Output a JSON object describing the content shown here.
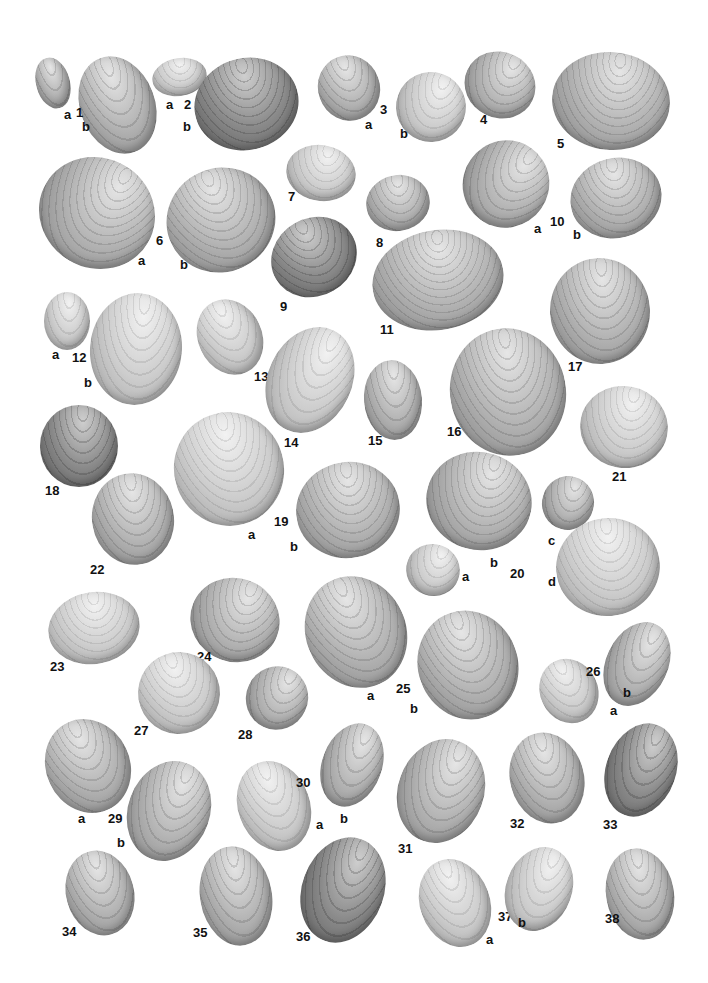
{
  "plate": {
    "background": "#ffffff",
    "specimens": [
      {
        "id": "1a",
        "x": 36,
        "y": 57,
        "w": 34,
        "h": 52,
        "r": -15,
        "tone": "",
        "label": "a",
        "lx": 64,
        "ly": 108
      },
      {
        "id": "1b",
        "x": 80,
        "y": 55,
        "w": 75,
        "h": 100,
        "r": -20,
        "tone": "",
        "label": "b",
        "lx": 82,
        "ly": 120
      },
      {
        "id": "1num",
        "label": "1",
        "lx": 76,
        "ly": 106
      },
      {
        "id": "2a",
        "x": 152,
        "y": 58,
        "w": 55,
        "h": 38,
        "r": -10,
        "tone": "light",
        "label": "a",
        "lx": 166,
        "ly": 98
      },
      {
        "id": "2num",
        "label": "2",
        "lx": 184,
        "ly": 98
      },
      {
        "id": "2b",
        "x": 194,
        "y": 58,
        "w": 105,
        "h": 92,
        "r": -15,
        "tone": "dark",
        "label": "b",
        "lx": 183,
        "ly": 120
      },
      {
        "id": "3a",
        "x": 318,
        "y": 55,
        "w": 62,
        "h": 66,
        "r": -20,
        "tone": "",
        "label": "a",
        "lx": 365,
        "ly": 118
      },
      {
        "id": "3num",
        "label": "3",
        "lx": 380,
        "ly": 103
      },
      {
        "id": "3b",
        "x": 396,
        "y": 72,
        "w": 70,
        "h": 70,
        "r": 20,
        "tone": "light",
        "label": "b",
        "lx": 400,
        "ly": 127
      },
      {
        "id": "4",
        "x": 464,
        "y": 52,
        "w": 72,
        "h": 66,
        "r": 25,
        "tone": "",
        "label": "4",
        "lx": 480,
        "ly": 113
      },
      {
        "id": "5",
        "x": 552,
        "y": 52,
        "w": 118,
        "h": 98,
        "r": 5,
        "tone": "",
        "label": "5",
        "lx": 557,
        "ly": 137
      },
      {
        "id": "6a",
        "x": 38,
        "y": 158,
        "w": 118,
        "h": 110,
        "r": 30,
        "tone": "",
        "label": "a",
        "lx": 138,
        "ly": 254
      },
      {
        "id": "6num",
        "label": "6",
        "lx": 156,
        "ly": 234
      },
      {
        "id": "6b",
        "x": 166,
        "y": 168,
        "w": 110,
        "h": 104,
        "r": -25,
        "tone": "",
        "label": "b",
        "lx": 180,
        "ly": 258
      },
      {
        "id": "7",
        "x": 286,
        "y": 145,
        "w": 70,
        "h": 56,
        "r": 10,
        "tone": "light",
        "label": "7",
        "lx": 288,
        "ly": 190
      },
      {
        "id": "8",
        "x": 366,
        "y": 175,
        "w": 64,
        "h": 56,
        "r": -10,
        "tone": "",
        "label": "8",
        "lx": 376,
        "ly": 236
      },
      {
        "id": "9",
        "x": 270,
        "y": 218,
        "w": 88,
        "h": 78,
        "r": -30,
        "tone": "dark",
        "label": "9",
        "lx": 280,
        "ly": 300
      },
      {
        "id": "10a",
        "x": 463,
        "y": 140,
        "w": 86,
        "h": 88,
        "r": 35,
        "tone": "",
        "label": "a",
        "lx": 534,
        "ly": 222
      },
      {
        "id": "10num",
        "label": "10",
        "lx": 550,
        "ly": 215
      },
      {
        "id": "10b",
        "x": 570,
        "y": 158,
        "w": 92,
        "h": 80,
        "r": -15,
        "tone": "",
        "label": "b",
        "lx": 573,
        "ly": 228
      },
      {
        "id": "11",
        "x": 372,
        "y": 230,
        "w": 132,
        "h": 100,
        "r": -10,
        "tone": "",
        "label": "11",
        "lx": 380,
        "ly": 323
      },
      {
        "id": "12a",
        "x": 44,
        "y": 292,
        "w": 46,
        "h": 58,
        "r": 0,
        "tone": "light",
        "label": "a",
        "lx": 52,
        "ly": 348
      },
      {
        "id": "12num",
        "label": "12",
        "lx": 72,
        "ly": 351
      },
      {
        "id": "12b",
        "x": 90,
        "y": 293,
        "w": 92,
        "h": 112,
        "r": 5,
        "tone": "light",
        "label": "b",
        "lx": 84,
        "ly": 376
      },
      {
        "id": "13",
        "x": 198,
        "y": 298,
        "w": 64,
        "h": 78,
        "r": -25,
        "tone": "light",
        "label": "13",
        "lx": 254,
        "ly": 370
      },
      {
        "id": "14",
        "x": 268,
        "y": 325,
        "w": 84,
        "h": 110,
        "r": 25,
        "tone": "light",
        "label": "14",
        "lx": 284,
        "ly": 436
      },
      {
        "id": "15",
        "x": 364,
        "y": 360,
        "w": 58,
        "h": 80,
        "r": -5,
        "tone": "",
        "label": "15",
        "lx": 368,
        "ly": 434
      },
      {
        "id": "16",
        "x": 450,
        "y": 328,
        "w": 116,
        "h": 128,
        "r": -10,
        "tone": "",
        "label": "16",
        "lx": 447,
        "ly": 425
      },
      {
        "id": "17",
        "x": 550,
        "y": 258,
        "w": 100,
        "h": 106,
        "r": -5,
        "tone": "",
        "label": "17",
        "lx": 568,
        "ly": 360
      },
      {
        "id": "18",
        "x": 40,
        "y": 405,
        "w": 78,
        "h": 82,
        "r": 0,
        "tone": "dark",
        "label": "18",
        "lx": 45,
        "ly": 484
      },
      {
        "id": "19a",
        "x": 174,
        "y": 412,
        "w": 110,
        "h": 114,
        "r": -15,
        "tone": "light",
        "label": "a",
        "lx": 248,
        "ly": 528
      },
      {
        "id": "19num",
        "label": "19",
        "lx": 274,
        "ly": 515
      },
      {
        "id": "19b",
        "x": 296,
        "y": 462,
        "w": 104,
        "h": 96,
        "r": -10,
        "tone": "",
        "label": "b",
        "lx": 290,
        "ly": 540
      },
      {
        "id": "20a",
        "x": 406,
        "y": 544,
        "w": 54,
        "h": 52,
        "r": 20,
        "tone": "light",
        "label": "a",
        "lx": 462,
        "ly": 570
      },
      {
        "id": "20b",
        "x": 426,
        "y": 452,
        "w": 106,
        "h": 98,
        "r": 15,
        "tone": "",
        "label": "b",
        "lx": 490,
        "ly": 556
      },
      {
        "id": "20num",
        "label": "20",
        "lx": 510,
        "ly": 567
      },
      {
        "id": "20c",
        "x": 542,
        "y": 476,
        "w": 52,
        "h": 54,
        "r": 15,
        "tone": "",
        "label": "c",
        "lx": 548,
        "ly": 534
      },
      {
        "id": "20d",
        "x": 556,
        "y": 518,
        "w": 104,
        "h": 98,
        "r": -10,
        "tone": "light",
        "label": "d",
        "lx": 548,
        "ly": 575
      },
      {
        "id": "21",
        "x": 580,
        "y": 386,
        "w": 88,
        "h": 82,
        "r": 10,
        "tone": "light",
        "label": "21",
        "lx": 612,
        "ly": 470
      },
      {
        "id": "22",
        "x": 92,
        "y": 473,
        "w": 82,
        "h": 92,
        "r": -10,
        "tone": "",
        "label": "22",
        "lx": 90,
        "ly": 563
      },
      {
        "id": "23",
        "x": 48,
        "y": 592,
        "w": 92,
        "h": 72,
        "r": -10,
        "tone": "light",
        "label": "23",
        "lx": 50,
        "ly": 660
      },
      {
        "id": "24",
        "x": 190,
        "y": 578,
        "w": 90,
        "h": 84,
        "r": 20,
        "tone": "",
        "label": "24",
        "lx": 197,
        "ly": 650
      },
      {
        "id": "25a",
        "x": 306,
        "y": 575,
        "w": 100,
        "h": 114,
        "r": -25,
        "tone": "",
        "label": "a",
        "lx": 367,
        "ly": 689
      },
      {
        "id": "25num",
        "label": "25",
        "lx": 396,
        "ly": 682
      },
      {
        "id": "25b",
        "x": 418,
        "y": 610,
        "w": 100,
        "h": 110,
        "r": -20,
        "tone": "",
        "label": "b",
        "lx": 410,
        "ly": 702
      },
      {
        "id": "26a",
        "x": 540,
        "y": 658,
        "w": 58,
        "h": 66,
        "r": -25,
        "tone": "light",
        "label": "a",
        "lx": 610,
        "ly": 704
      },
      {
        "id": "26num",
        "label": "26",
        "lx": 586,
        "ly": 665
      },
      {
        "id": "26b",
        "x": 606,
        "y": 620,
        "w": 62,
        "h": 88,
        "r": 25,
        "tone": "",
        "label": "b",
        "lx": 623,
        "ly": 686
      },
      {
        "id": "27",
        "x": 138,
        "y": 652,
        "w": 82,
        "h": 82,
        "r": -20,
        "tone": "light",
        "label": "27",
        "lx": 134,
        "ly": 724
      },
      {
        "id": "28",
        "x": 246,
        "y": 666,
        "w": 62,
        "h": 64,
        "r": 25,
        "tone": "",
        "label": "28",
        "lx": 238,
        "ly": 728
      },
      {
        "id": "29a",
        "x": 46,
        "y": 718,
        "w": 84,
        "h": 96,
        "r": -25,
        "tone": "",
        "label": "a",
        "lx": 78,
        "ly": 812
      },
      {
        "id": "29num",
        "label": "29",
        "lx": 108,
        "ly": 812
      },
      {
        "id": "29b",
        "x": 128,
        "y": 760,
        "w": 82,
        "h": 102,
        "r": 20,
        "tone": "",
        "label": "b",
        "lx": 117,
        "ly": 836
      },
      {
        "id": "30a",
        "x": 238,
        "y": 760,
        "w": 72,
        "h": 92,
        "r": -20,
        "tone": "light",
        "label": "a",
        "lx": 316,
        "ly": 818
      },
      {
        "id": "30num",
        "label": "30",
        "lx": 296,
        "ly": 776
      },
      {
        "id": "30b",
        "x": 322,
        "y": 722,
        "w": 60,
        "h": 86,
        "r": 20,
        "tone": "",
        "label": "b",
        "lx": 340,
        "ly": 812
      },
      {
        "id": "31",
        "x": 398,
        "y": 738,
        "w": 86,
        "h": 106,
        "r": 20,
        "tone": "",
        "label": "31",
        "lx": 398,
        "ly": 842
      },
      {
        "id": "32",
        "x": 510,
        "y": 732,
        "w": 74,
        "h": 92,
        "r": -15,
        "tone": "",
        "label": "32",
        "lx": 510,
        "ly": 817
      },
      {
        "id": "33",
        "x": 606,
        "y": 722,
        "w": 70,
        "h": 96,
        "r": 20,
        "tone": "dark",
        "label": "33",
        "lx": 603,
        "ly": 818
      },
      {
        "id": "34",
        "x": 66,
        "y": 850,
        "w": 68,
        "h": 86,
        "r": -15,
        "tone": "",
        "label": "34",
        "lx": 62,
        "ly": 925
      },
      {
        "id": "35",
        "x": 200,
        "y": 846,
        "w": 72,
        "h": 100,
        "r": -10,
        "tone": "",
        "label": "35",
        "lx": 193,
        "ly": 926
      },
      {
        "id": "36",
        "x": 302,
        "y": 836,
        "w": 82,
        "h": 108,
        "r": 20,
        "tone": "dark",
        "label": "36",
        "lx": 296,
        "ly": 930
      },
      {
        "id": "37a",
        "x": 420,
        "y": 858,
        "w": 70,
        "h": 90,
        "r": -20,
        "tone": "light",
        "label": "a",
        "lx": 486,
        "ly": 933
      },
      {
        "id": "37num",
        "label": "37",
        "lx": 498,
        "ly": 910
      },
      {
        "id": "37b",
        "x": 506,
        "y": 846,
        "w": 66,
        "h": 86,
        "r": 20,
        "tone": "light",
        "label": "b",
        "lx": 518,
        "ly": 916
      },
      {
        "id": "38",
        "x": 606,
        "y": 848,
        "w": 68,
        "h": 92,
        "r": -10,
        "tone": "",
        "label": "38",
        "lx": 605,
        "ly": 912
      }
    ]
  }
}
